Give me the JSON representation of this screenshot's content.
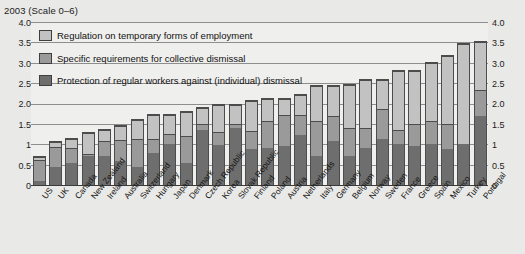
{
  "title": "2003 (Scale 0–6)",
  "legend": {
    "items": [
      {
        "key": "temporary",
        "label": "Regulation on temporary forms of employment",
        "color": "#c2c2c2"
      },
      {
        "key": "collective",
        "label": "Specific requirements for collective dismissal",
        "color": "#9a9a9a"
      },
      {
        "key": "regular",
        "label": "Protection of regular workers against (individual) dismissal",
        "color": "#6e6e6e"
      }
    ]
  },
  "axis": {
    "y_ticks_left": [
      "4.0",
      "3.5",
      "3.0",
      "2.5",
      "2.0",
      "1.5",
      "1",
      "0.5",
      "0"
    ],
    "y_ticks_right": [
      "4.0",
      "3.5",
      "3.0",
      "2.5",
      "2.0",
      "1.5",
      "1",
      "0.5",
      "0"
    ]
  },
  "chart_data": {
    "type": "bar",
    "title": "2003 (Scale 0–6)",
    "xlabel": "",
    "ylabel": "",
    "ylim": [
      0,
      4.0
    ],
    "yticks": [
      0,
      0.5,
      1,
      1.5,
      2.0,
      2.5,
      3.0,
      3.5,
      4.0
    ],
    "grid": true,
    "stacked": true,
    "legend_position": "top-left inside plot",
    "categories": [
      "US",
      "UK",
      "Canada",
      "New Zealand",
      "Ireland",
      "Australia",
      "Switzerland",
      "Hungary",
      "Japan",
      "Denmark",
      "Czech Republic",
      "Korea",
      "Slovak Republic",
      "Finland",
      "Poland",
      "Austria",
      "Netherlands",
      "Italy",
      "Germany",
      "Belgium",
      "Norway",
      "Sweden",
      "France",
      "Greece",
      "Spain",
      "Mexico",
      "Turkey",
      "Portugal"
    ],
    "series": [
      {
        "name": "Protection of regular workers against (individual) dismissal",
        "color": "#6e6e6e",
        "values": [
          0.1,
          0.45,
          0.55,
          0.7,
          0.7,
          0.58,
          0.43,
          0.78,
          1.0,
          0.55,
          1.36,
          0.98,
          1.41,
          0.88,
          0.9,
          0.96,
          1.23,
          0.7,
          1.09,
          0.7,
          0.91,
          1.14,
          1.0,
          0.96,
          1.0,
          0.89,
          1.0,
          1.69
        ]
      },
      {
        "name": "Specific requirements for collective dismissal",
        "color": "#9a9a9a",
        "values": [
          0.52,
          0.49,
          0.35,
          0.05,
          0.38,
          0.53,
          0.7,
          0.34,
          0.26,
          0.65,
          0.14,
          0.32,
          0.09,
          0.45,
          0.68,
          0.75,
          0.49,
          0.86,
          0.61,
          0.69,
          0.5,
          0.73,
          0.35,
          0.54,
          0.56,
          0.61,
          0.0,
          0.65
        ]
      },
      {
        "name": "Regulation on temporary forms of employment",
        "color": "#c2c2c2",
        "values": [
          0.06,
          0.11,
          0.23,
          0.52,
          0.26,
          0.33,
          0.46,
          0.61,
          0.47,
          0.6,
          0.39,
          0.66,
          0.47,
          0.72,
          0.52,
          0.39,
          0.5,
          0.87,
          0.72,
          1.07,
          1.16,
          0.7,
          1.45,
          1.3,
          1.44,
          1.66,
          2.47,
          1.16
        ]
      }
    ],
    "totals": [
      0.68,
      1.05,
      1.13,
      1.27,
      1.34,
      1.44,
      1.59,
      1.73,
      1.73,
      1.8,
      1.89,
      1.96,
      1.97,
      2.05,
      2.1,
      2.1,
      2.22,
      2.43,
      2.42,
      2.46,
      2.57,
      2.57,
      2.8,
      2.8,
      3.0,
      3.16,
      3.47,
      3.5
    ]
  }
}
